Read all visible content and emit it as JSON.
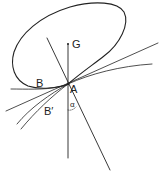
{
  "figure": {
    "stroke_color": "#222222",
    "labels": {
      "G": "G",
      "A": "A",
      "B": "B",
      "B_prime": "B′",
      "alpha": "α"
    }
  }
}
